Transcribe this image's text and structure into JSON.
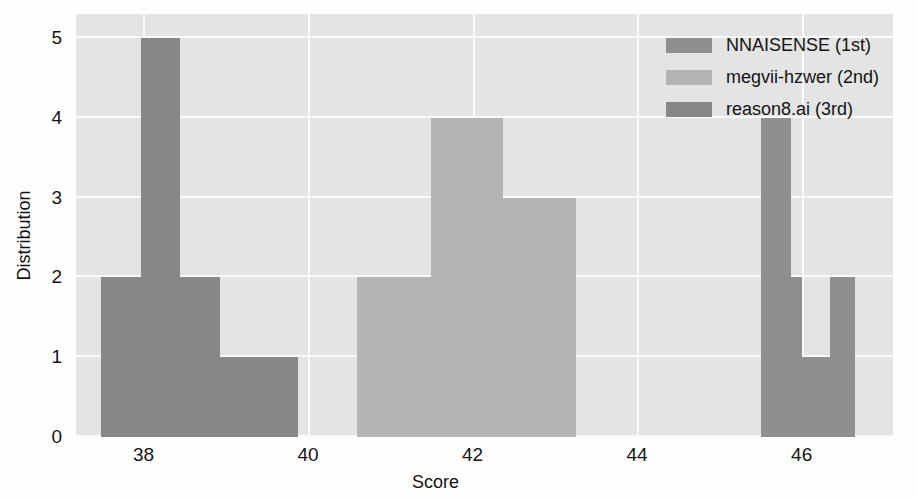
{
  "chart_data": {
    "type": "bar",
    "subtype": "histogram-overlapping",
    "title": "",
    "xlabel": "Score",
    "ylabel": "Distribution",
    "xlim": [
      37.18,
      47.11
    ],
    "ylim": [
      0,
      5.3
    ],
    "xticks": [
      38,
      40,
      42,
      44,
      46
    ],
    "xticklabels": [
      "38",
      "40",
      "42",
      "44",
      "46"
    ],
    "yticks": [
      0,
      1,
      2,
      3,
      4,
      5
    ],
    "yticklabels": [
      "0",
      "1",
      "2",
      "3",
      "4",
      "5"
    ],
    "grid": true,
    "grid_color": "#fafafa",
    "plot_bgcolor": "#e4e4e4",
    "legend_position": "upper right",
    "legend": [
      {
        "label": "NNAISENSE (1st)",
        "color": "#8f8f8f"
      },
      {
        "label": "megvii-hzwer (2nd)",
        "color": "#b4b4b4"
      },
      {
        "label": "reason8.ai (3rd)",
        "color": "#878787"
      }
    ],
    "series": [
      {
        "name": "NNAISENSE (1st)",
        "color": "#8f8f8f",
        "bins": [
          {
            "x0": 45.5,
            "x1": 45.87,
            "count": 4
          },
          {
            "x0": 45.87,
            "x1": 46.0,
            "count": 2
          },
          {
            "x0": 46.0,
            "x1": 46.35,
            "count": 1
          },
          {
            "x0": 46.35,
            "x1": 46.65,
            "count": 2
          }
        ]
      },
      {
        "name": "megvii-hzwer (2nd)",
        "color": "#b4b4b4",
        "bins": [
          {
            "x0": 40.6,
            "x1": 41.49,
            "count": 2
          },
          {
            "x0": 41.49,
            "x1": 42.37,
            "count": 4
          },
          {
            "x0": 42.37,
            "x1": 43.26,
            "count": 3
          }
        ]
      },
      {
        "name": "reason8.ai (3rd)",
        "color": "#878787",
        "bins": [
          {
            "x0": 37.48,
            "x1": 37.97,
            "count": 2
          },
          {
            "x0": 37.97,
            "x1": 38.45,
            "count": 5
          },
          {
            "x0": 38.45,
            "x1": 38.93,
            "count": 2
          },
          {
            "x0": 38.93,
            "x1": 39.4,
            "count": 1
          },
          {
            "x0": 39.4,
            "x1": 39.88,
            "count": 1
          }
        ]
      }
    ]
  }
}
